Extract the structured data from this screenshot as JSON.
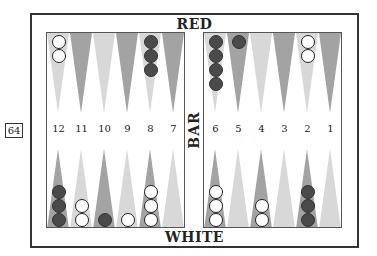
{
  "board": {
    "top_label": "RED",
    "bottom_label": "WHITE",
    "bar_label": "BAR",
    "position_id": "64",
    "colors": {
      "frame": "#333333",
      "triangle_dark": "#a3a3a3",
      "triangle_light": "#d8d8d8",
      "checker_white": "#ffffff",
      "checker_red": "#4a4a4a"
    },
    "left_points": [
      {
        "number": "12",
        "top_shade": "light",
        "bottom_shade": "dark",
        "top_checkers": {
          "color": "white",
          "count": 2
        },
        "bottom_checkers": {
          "color": "red",
          "count": 3
        }
      },
      {
        "number": "11",
        "top_shade": "dark",
        "bottom_shade": "light",
        "top_checkers": {
          "color": "",
          "count": 0
        },
        "bottom_checkers": {
          "color": "white",
          "count": 2
        }
      },
      {
        "number": "10",
        "top_shade": "light",
        "bottom_shade": "dark",
        "top_checkers": {
          "color": "",
          "count": 0
        },
        "bottom_checkers": {
          "color": "red",
          "count": 1
        }
      },
      {
        "number": "9",
        "top_shade": "dark",
        "bottom_shade": "light",
        "top_checkers": {
          "color": "",
          "count": 0
        },
        "bottom_checkers": {
          "color": "white",
          "count": 1
        }
      },
      {
        "number": "8",
        "top_shade": "light",
        "bottom_shade": "dark",
        "top_checkers": {
          "color": "red",
          "count": 3
        },
        "bottom_checkers": {
          "color": "white",
          "count": 3
        }
      },
      {
        "number": "7",
        "top_shade": "dark",
        "bottom_shade": "light",
        "top_checkers": {
          "color": "",
          "count": 0
        },
        "bottom_checkers": {
          "color": "",
          "count": 0
        }
      }
    ],
    "right_points": [
      {
        "number": "6",
        "top_shade": "light",
        "bottom_shade": "dark",
        "top_checkers": {
          "color": "red",
          "count": 4
        },
        "bottom_checkers": {
          "color": "white",
          "count": 3
        }
      },
      {
        "number": "5",
        "top_shade": "dark",
        "bottom_shade": "light",
        "top_checkers": {
          "color": "red",
          "count": 1
        },
        "bottom_checkers": {
          "color": "",
          "count": 0
        }
      },
      {
        "number": "4",
        "top_shade": "light",
        "bottom_shade": "dark",
        "top_checkers": {
          "color": "",
          "count": 0
        },
        "bottom_checkers": {
          "color": "white",
          "count": 2
        }
      },
      {
        "number": "3",
        "top_shade": "dark",
        "bottom_shade": "light",
        "top_checkers": {
          "color": "",
          "count": 0
        },
        "bottom_checkers": {
          "color": "",
          "count": 0
        }
      },
      {
        "number": "2",
        "top_shade": "light",
        "bottom_shade": "dark",
        "top_checkers": {
          "color": "white",
          "count": 2
        },
        "bottom_checkers": {
          "color": "red",
          "count": 3
        }
      },
      {
        "number": "1",
        "top_shade": "dark",
        "bottom_shade": "light",
        "top_checkers": {
          "color": "",
          "count": 0
        },
        "bottom_checkers": {
          "color": "",
          "count": 0
        }
      }
    ]
  }
}
